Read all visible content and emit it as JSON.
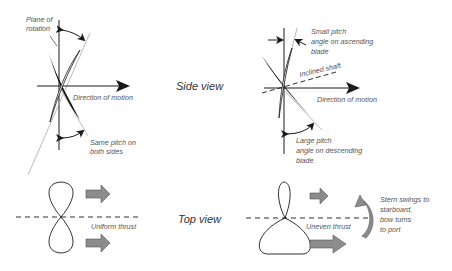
{
  "colors": {
    "ink": "#1a1a1a",
    "label": "#555555",
    "thrust_arrow_fill": "#8c8c8c",
    "thrust_arrow_stroke": "#555555",
    "pitch_line": "#aaaaaa"
  },
  "section_labels": {
    "side_view": "Side view",
    "top_view": "Top view"
  },
  "left_side_view": {
    "plane_label_line1": "Plane of",
    "plane_label_line2": "rotation",
    "direction_label": "Direction of motion",
    "pitch_label_line1": "Same pitch on",
    "pitch_label_line2": "both sides"
  },
  "right_side_view": {
    "small_pitch_line1": "Small pitch",
    "small_pitch_line2": "angle on ascending",
    "small_pitch_line3": "blade",
    "shaft_label": "Inclined shaft",
    "direction_label": "Direction of motion",
    "large_pitch_line1": "Large pitch",
    "large_pitch_line2": "angle on descending",
    "large_pitch_line3": "blade"
  },
  "left_top_view": {
    "thrust_label": "Uniform thrust"
  },
  "right_top_view": {
    "thrust_label": "Uneven thrust",
    "turn_line1": "Stern swings to",
    "turn_line2": "starboard,",
    "turn_line3": "bow turns",
    "turn_line4": "to port"
  }
}
